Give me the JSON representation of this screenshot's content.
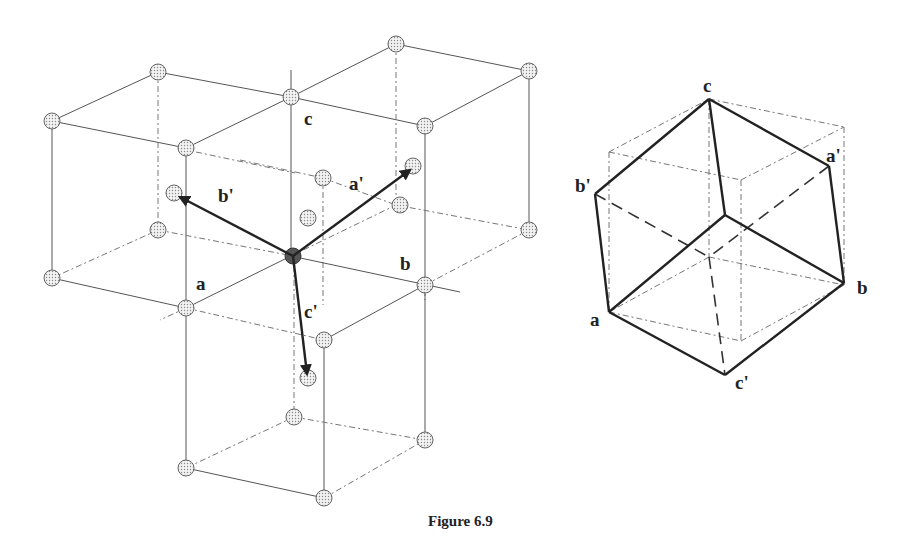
{
  "figure": {
    "caption": "Figure 6.9"
  },
  "left_diagram": {
    "description": "Lattice of cubes sharing a central lattice point, with primitive vectors a', b', c' drawn from the center",
    "labels": {
      "a": "a",
      "b": "b",
      "c": "c",
      "a_prime": "a'",
      "b_prime": "b'",
      "c_prime": "c'"
    }
  },
  "right_diagram": {
    "description": "Rhombohedral primitive cell inscribed in conventional cube",
    "labels": {
      "a": "a",
      "b": "b",
      "c": "c",
      "a_prime": "a'",
      "b_prime": "b'",
      "c_prime": "c'"
    }
  }
}
